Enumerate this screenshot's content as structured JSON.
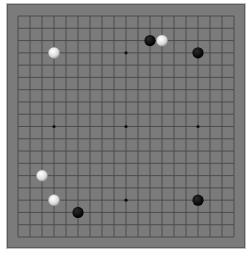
{
  "game": {
    "type": "go",
    "board_size": 19,
    "colors": {
      "board": "#7b7b7b",
      "grid": "#484848",
      "black_stone": "#0a0a0a",
      "white_stone": "#e6e6e6"
    },
    "star_points": [
      [
        3,
        3
      ],
      [
        9,
        3
      ],
      [
        15,
        3
      ],
      [
        3,
        9
      ],
      [
        9,
        9
      ],
      [
        15,
        9
      ],
      [
        3,
        15
      ],
      [
        9,
        15
      ],
      [
        15,
        15
      ]
    ],
    "stones": [
      {
        "color": "black",
        "col": 11,
        "row": 2
      },
      {
        "color": "white",
        "col": 12,
        "row": 2
      },
      {
        "color": "black",
        "col": 15,
        "row": 3
      },
      {
        "color": "white",
        "col": 3,
        "row": 3
      },
      {
        "color": "white",
        "col": 2,
        "row": 13
      },
      {
        "color": "white",
        "col": 3,
        "row": 15
      },
      {
        "color": "black",
        "col": 15,
        "row": 15
      },
      {
        "color": "black",
        "col": 5,
        "row": 16
      }
    ]
  }
}
